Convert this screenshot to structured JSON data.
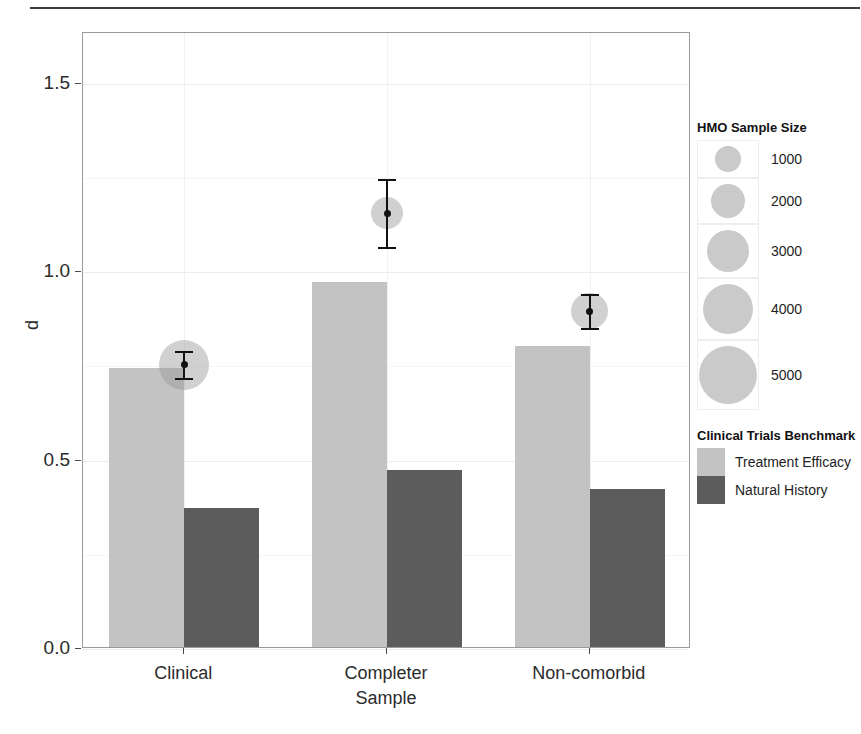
{
  "figure": {
    "has_top_rule": true
  },
  "chart_data": {
    "type": "bar",
    "title": "",
    "xlabel": "",
    "ylabel": "d",
    "ylim": [
      0,
      1.635
    ],
    "grid": true,
    "categories": [
      "Clinical",
      "Completer\nSample",
      "Non-comorbid"
    ],
    "y_ticks": [
      "0.0",
      "0.5",
      "1.0",
      "1.5"
    ],
    "y_tick_values": [
      0.0,
      0.5,
      1.0,
      1.5
    ],
    "legend_position": "right",
    "series": [
      {
        "name": "Treatment Efficacy",
        "color": "#c3c3c3",
        "values": [
          0.74,
          0.97,
          0.8
        ]
      },
      {
        "name": "Natural History",
        "color": "#5c5c5c",
        "values": [
          0.37,
          0.47,
          0.42
        ]
      }
    ],
    "points": [
      {
        "category": "Clinical",
        "value": 0.754,
        "ci_low": 0.718,
        "ci_high": 0.792,
        "sample_size": 4000
      },
      {
        "category": "Completer Sample",
        "value": 1.157,
        "ci_low": 1.067,
        "ci_high": 1.247,
        "sample_size": 1800
      },
      {
        "category": "Non-comorbid",
        "value": 0.897,
        "ci_low": 0.852,
        "ci_high": 0.942,
        "sample_size": 2300
      }
    ]
  },
  "legends": {
    "size": {
      "title": "HMO Sample Size",
      "items": [
        {
          "label": "1000",
          "diameter": 26
        },
        {
          "label": "2000",
          "diameter": 34
        },
        {
          "label": "3000",
          "diameter": 42
        },
        {
          "label": "4000",
          "diameter": 50
        },
        {
          "label": "5000",
          "diameter": 58
        }
      ]
    },
    "color": {
      "title": "Clinical Trials\nBenchmark",
      "items": [
        {
          "label": "Treatment Efficacy",
          "color": "#c3c3c3"
        },
        {
          "label": "Natural History",
          "color": "#5c5c5c"
        }
      ]
    }
  }
}
